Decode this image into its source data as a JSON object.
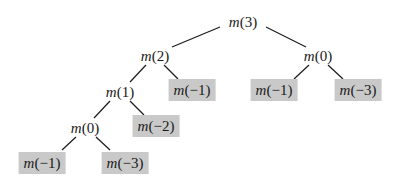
{
  "diagram": {
    "type": "recursion-tree",
    "leaf_fill": "#c9c9c9",
    "edge_color": "#1a1a1a",
    "nodes": [
      {
        "id": "n0",
        "fn": "m",
        "arg": "(3)",
        "leaf": false,
        "x": 243,
        "y": 22
      },
      {
        "id": "n1",
        "fn": "m",
        "arg": "(2)",
        "leaf": false,
        "x": 155,
        "y": 56
      },
      {
        "id": "n2",
        "fn": "m",
        "arg": "(0)",
        "leaf": false,
        "x": 318,
        "y": 56
      },
      {
        "id": "n3",
        "fn": "m",
        "arg": "(1)",
        "leaf": false,
        "x": 120,
        "y": 92
      },
      {
        "id": "n4",
        "fn": "m",
        "arg": "(−1)",
        "leaf": true,
        "x": 192,
        "y": 90
      },
      {
        "id": "n5",
        "fn": "m",
        "arg": "(−1)",
        "leaf": true,
        "x": 274,
        "y": 90
      },
      {
        "id": "n6",
        "fn": "m",
        "arg": "(−3)",
        "leaf": true,
        "x": 358,
        "y": 90
      },
      {
        "id": "n7",
        "fn": "m",
        "arg": "(0)",
        "leaf": false,
        "x": 85,
        "y": 128
      },
      {
        "id": "n8",
        "fn": "m",
        "arg": "(−2)",
        "leaf": true,
        "x": 156,
        "y": 126
      },
      {
        "id": "n9",
        "fn": "m",
        "arg": "(−1)",
        "leaf": true,
        "x": 42,
        "y": 163
      },
      {
        "id": "n10",
        "fn": "m",
        "arg": "(−3)",
        "leaf": true,
        "x": 125,
        "y": 163
      }
    ],
    "edges": [
      {
        "from": "n0",
        "to": "n1",
        "x1": 220,
        "y1": 27,
        "x2": 172,
        "y2": 47
      },
      {
        "from": "n0",
        "to": "n2",
        "x1": 266,
        "y1": 27,
        "x2": 306,
        "y2": 47
      },
      {
        "from": "n1",
        "to": "n3",
        "x1": 146,
        "y1": 65,
        "x2": 130,
        "y2": 82
      },
      {
        "from": "n1",
        "to": "n4",
        "x1": 164,
        "y1": 65,
        "x2": 178,
        "y2": 79
      },
      {
        "from": "n2",
        "to": "n5",
        "x1": 309,
        "y1": 65,
        "x2": 294,
        "y2": 79
      },
      {
        "from": "n2",
        "to": "n6",
        "x1": 328,
        "y1": 65,
        "x2": 343,
        "y2": 79
      },
      {
        "from": "n3",
        "to": "n7",
        "x1": 110,
        "y1": 101,
        "x2": 94,
        "y2": 118
      },
      {
        "from": "n3",
        "to": "n8",
        "x1": 130,
        "y1": 101,
        "x2": 144,
        "y2": 115
      },
      {
        "from": "n7",
        "to": "n9",
        "x1": 76,
        "y1": 137,
        "x2": 62,
        "y2": 150
      },
      {
        "from": "n7",
        "to": "n10",
        "x1": 96,
        "y1": 137,
        "x2": 110,
        "y2": 150
      }
    ]
  }
}
